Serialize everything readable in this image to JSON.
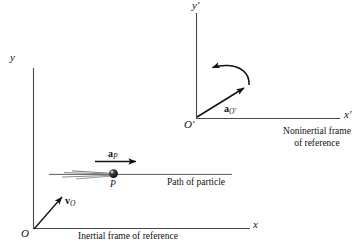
{
  "figure": {
    "background_color": "#ffffff",
    "line_color": "#111111"
  },
  "inertial_frame": {
    "origin_label": "O",
    "y_axis_label": "y",
    "x_axis_label": "x",
    "caption": "Inertial frame of reference",
    "velocity_vector": {
      "symbol": "v",
      "subscript": "O",
      "label": "v_O"
    }
  },
  "noninertial_frame": {
    "origin_label": "O′",
    "y_axis_label": "y′",
    "x_axis_label": "x′",
    "caption_line1": "Noninertial frame",
    "caption_line2": "of reference",
    "acceleration_vector": {
      "symbol": "a",
      "subscript": "O′",
      "label": "a_O′"
    },
    "rotation_arrow_name": "rotation-arrow"
  },
  "particle": {
    "point_label": "P",
    "path_label": "Path of particle",
    "acceleration_vector": {
      "symbol": "a",
      "subscript": "P",
      "label": "a_P"
    }
  }
}
